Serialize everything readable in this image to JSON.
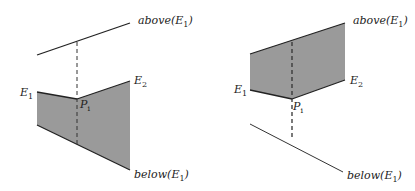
{
  "figures": [
    {
      "id": "left",
      "labels": {
        "above": "above(E",
        "above_sub": "1",
        "below": "below(E",
        "below_sub": "1",
        "e1": "E",
        "e1_sub": "1",
        "e2": "E",
        "e2_sub": "2",
        "p": "P",
        "p_sub": "i"
      },
      "description": "Point Pi lies between above(E1) and below(E1); shaded trapezoid spans E1 to E2 below Pi"
    },
    {
      "id": "right",
      "labels": {
        "above": "above(E",
        "above_sub": "1",
        "below": "below(E",
        "below_sub": "1",
        "e1": "E",
        "e1_sub": "1",
        "e2": "E",
        "e2_sub": "2",
        "p": "P",
        "p_sub": "i"
      },
      "description": "Shaded region spans from E1/E2 up to above(E1); below(E1) is a separate line"
    }
  ],
  "colors": {
    "fill": "#9a9a9a",
    "stroke": "#222222",
    "background": "#ffffff"
  }
}
